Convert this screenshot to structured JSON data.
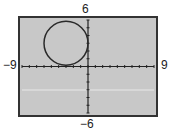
{
  "chart_data": {
    "type": "line",
    "title": "",
    "xlabel": "",
    "ylabel": "",
    "xlim": [
      -9,
      9
    ],
    "ylim": [
      -6,
      6
    ],
    "tick_labels": {
      "xmin": "-9",
      "xmax": "9",
      "ymin": "-6",
      "ymax": "6"
    },
    "grid": false,
    "series": [
      {
        "name": "circle",
        "equation": "(x+3)^2 + (y-3)^2 = 9",
        "center": [
          -3,
          3
        ],
        "radius": 3
      }
    ],
    "ticks_every": 1
  },
  "labels": {
    "ymax": "6",
    "ymin": "−6",
    "xmin": "−9",
    "xmax": "9"
  },
  "colors": {
    "screen": "#c8c8c8",
    "frame": "#333333",
    "curve": "#2a2a2a"
  }
}
